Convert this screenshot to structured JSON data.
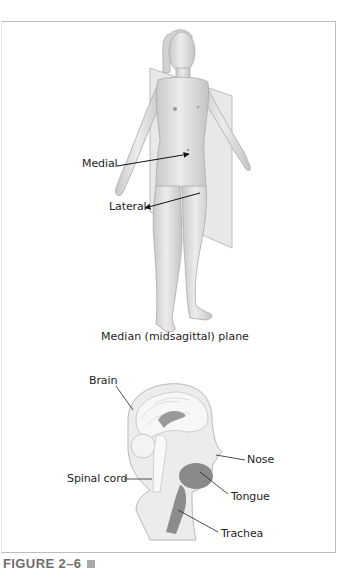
{
  "figure": {
    "label": "FIGURE 2–6",
    "marker_icon": "square-icon",
    "colors": {
      "border": "#bdbdbd",
      "figure_label": "#6e6e6e",
      "skin": "#dcdcdc",
      "plane": "#e6e6e6",
      "head_fill": "#ececec",
      "brain_fill": "#f7f7f7",
      "organ_dark": "#8a8a8a"
    }
  },
  "upper_panel": {
    "title": "Median (midsagittal) plane",
    "labels": {
      "medial": "Medial",
      "lateral": "Lateral"
    }
  },
  "lower_panel": {
    "labels": {
      "brain": "Brain",
      "spinal_cord": "Spinal cord",
      "nose": "Nose",
      "tongue": "Tongue",
      "trachea": "Trachea"
    }
  }
}
